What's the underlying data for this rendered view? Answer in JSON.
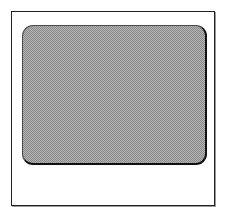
{
  "figure": {
    "frame": {
      "border_color": "#222222",
      "background_color": "#ffffff"
    },
    "panel": {
      "fill_pattern": "dithered-checker",
      "fill_color_light": "#b4b4b4",
      "fill_color_dark": "#8a8a8a",
      "border_color": "#111111",
      "corner_style": "rounded"
    }
  }
}
